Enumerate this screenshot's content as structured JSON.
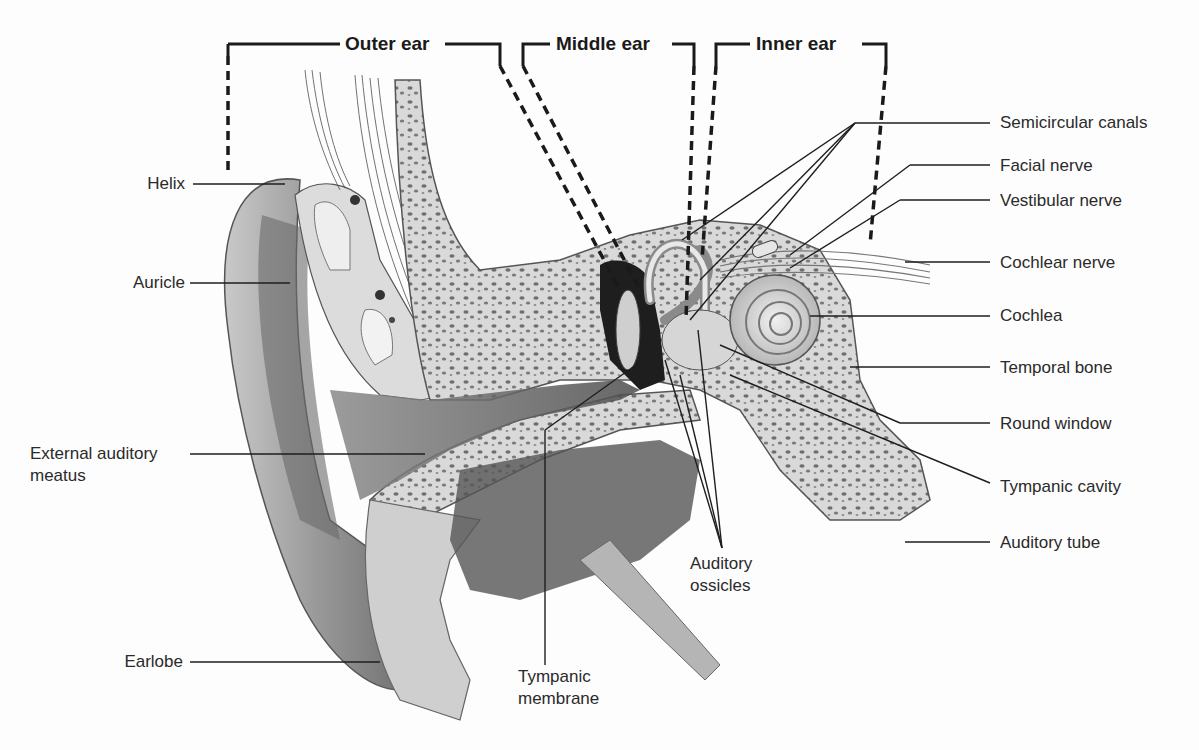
{
  "diagram": {
    "sections": [
      {
        "label": "Outer ear"
      },
      {
        "label": "Middle ear"
      },
      {
        "label": "Inner ear"
      }
    ],
    "labels_left": [
      {
        "label": "Helix"
      },
      {
        "label": "Auricle"
      },
      {
        "label": "External auditory",
        "label2": "meatus"
      },
      {
        "label": "Earlobe"
      }
    ],
    "labels_bottom": [
      {
        "label": "Tympanic",
        "label2": "membrane"
      },
      {
        "label": "Auditory",
        "label2": "ossicles"
      }
    ],
    "labels_right": [
      {
        "label": "Semicircular canals"
      },
      {
        "label": "Facial nerve"
      },
      {
        "label": "Vestibular nerve"
      },
      {
        "label": "Cochlear nerve"
      },
      {
        "label": "Cochlea"
      },
      {
        "label": "Temporal bone"
      },
      {
        "label": "Round window"
      },
      {
        "label": "Tympanic cavity"
      },
      {
        "label": "Auditory tube"
      }
    ]
  }
}
